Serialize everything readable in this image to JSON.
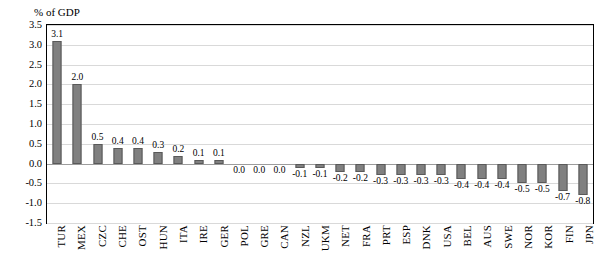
{
  "chart_data": {
    "type": "bar",
    "title": "",
    "ylabel": "% of GDP",
    "xlabel": "",
    "ylim": [
      -1.5,
      3.5
    ],
    "ytick_labels": [
      "3.5",
      "3.0",
      "2.5",
      "2.0",
      "1.5",
      "1.0",
      "0.5",
      "0.0",
      "-0.5",
      "-1.0",
      "-1.5"
    ],
    "ytick_values": [
      3.5,
      3.0,
      2.5,
      2.0,
      1.5,
      1.0,
      0.5,
      0.0,
      -0.5,
      -1.0,
      -1.5
    ],
    "grid": true,
    "legend": "none",
    "bar_color": "#808080",
    "categories": [
      "TUR",
      "MEX",
      "CZC",
      "CHE",
      "OST",
      "HUN",
      "ITA",
      "IRE",
      "GER",
      "POL",
      "GRE",
      "CAN",
      "NZL",
      "UKM",
      "NET",
      "FRA",
      "PRT",
      "ESP",
      "DNK",
      "USA",
      "BEL",
      "AUS",
      "SWE",
      "NOR",
      "KOR",
      "FIN",
      "JPN"
    ],
    "values": [
      3.1,
      2.0,
      0.5,
      0.4,
      0.4,
      0.3,
      0.2,
      0.1,
      0.1,
      0.0,
      0.0,
      0.0,
      -0.1,
      -0.1,
      -0.2,
      -0.2,
      -0.3,
      -0.3,
      -0.3,
      -0.3,
      -0.4,
      -0.4,
      -0.4,
      -0.5,
      -0.5,
      -0.7,
      -0.8
    ],
    "data_labels": [
      "3.1",
      "2.0",
      "0.5",
      "0.4",
      "0.4",
      "0.3",
      "0.2",
      "0.1",
      "0.1",
      "0.0",
      "0.0",
      "0.0",
      "-0.1",
      "-0.1",
      "-0.2",
      "-0.2",
      "-0.3",
      "-0.3",
      "-0.3",
      "-0.3",
      "-0.4",
      "-0.4",
      "-0.4",
      "-0.5",
      "-0.5",
      "-0.7",
      "-0.8"
    ]
  }
}
